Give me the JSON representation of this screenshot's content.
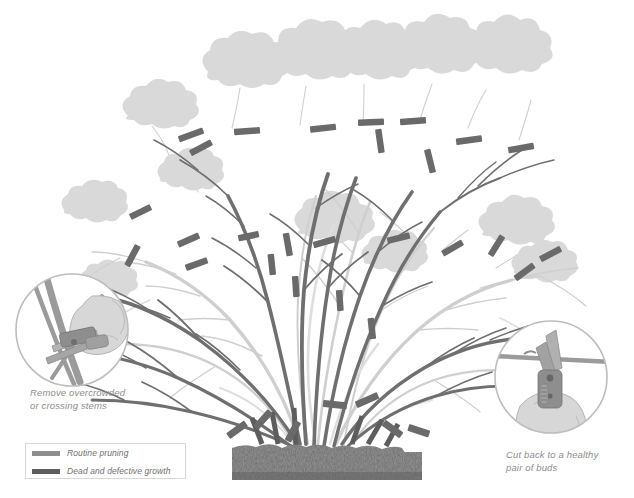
{
  "illustration": {
    "title": "Shrub renewal pruning diagram",
    "subject": "deciduous shrub",
    "background_color": "#ffffff"
  },
  "palette": {
    "live_stem": "#6f6f6f",
    "live_stem_dark": "#5d5d5d",
    "ghost_stem": "#c9c9c9",
    "ghost_stem_light": "#dcdcdc",
    "cut_mark": "#6a6a6a",
    "foliage": "#d9d9d9",
    "foliage_edge": "#d2d2d2",
    "soil": "#6b6b6b",
    "soil_dark": "#5a5a5a",
    "inset_circle": "#bdbdbd",
    "text": "#8d8d8d",
    "legend_border": "#d8d8d8",
    "tool_blade": "#9a9a9a",
    "tool_body": "#7d7d7d",
    "hand": "#d5d5d5"
  },
  "insets": [
    {
      "id": "remove-crossing",
      "position": "bottom-left",
      "caption": "Remove overcrowded\nor crossing stems",
      "depicts": "secateurs cutting a crossing stem at its base, held in a gloved hand",
      "circle": {
        "cx": 72,
        "cy": 330,
        "r": 57
      }
    },
    {
      "id": "cut-to-buds",
      "position": "bottom-right",
      "caption": "Cut back to a healthy\npair of buds",
      "depicts": "secateurs held vertically cutting a horizontal stem just above a bud pair",
      "circle": {
        "cx": 551,
        "cy": 377,
        "r": 57
      }
    }
  ],
  "legend": {
    "items": [
      {
        "label": "Routine pruning",
        "color": "#8e8e8e"
      },
      {
        "label": "Dead and defective growth",
        "color": "#5d5d5d"
      }
    ]
  },
  "soil": {
    "x": 232,
    "y": 443,
    "width": 190,
    "height": 37,
    "label": "soil line"
  },
  "counts": {
    "main_stems": 11,
    "cut_marks": 31,
    "foliage_clouds": 13
  }
}
